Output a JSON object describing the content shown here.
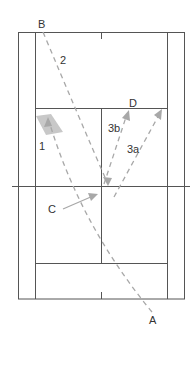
{
  "diagram": {
    "title": "",
    "type": "badminton-court-shot-diagram",
    "colors": {
      "court_line": "#555555",
      "path": "#a8a8a8",
      "shaded_area": "#c8c8c8",
      "label": "#333333",
      "background": "#ffffff"
    },
    "labels": {
      "B": "B",
      "A": "A",
      "D": "D",
      "C": "C",
      "shot1": "1",
      "shot2": "2",
      "shot3a": "3a",
      "shot3b": "3b"
    }
  }
}
